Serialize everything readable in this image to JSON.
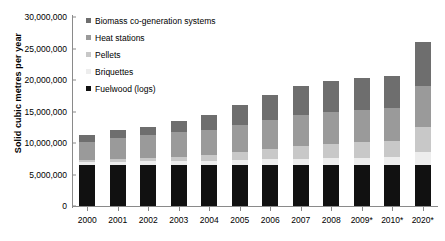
{
  "chart_data": {
    "type": "bar",
    "stacked": true,
    "title": "",
    "xlabel": "",
    "ylabel": "Solid cubic metres per year",
    "ylim": [
      0,
      30000000
    ],
    "ytick_step": 5000000,
    "ytick_labels": [
      "30,000,000",
      "25,000,000",
      "20,000,000",
      "15,000,000",
      "10,000,000",
      "5,000,000",
      "0"
    ],
    "ytick_values": [
      30000000,
      25000000,
      20000000,
      15000000,
      10000000,
      5000000,
      0
    ],
    "grid": false,
    "legend_position": "top-left",
    "categories": [
      "2000",
      "2001",
      "2002",
      "2003",
      "2004",
      "2005",
      "2006",
      "2007",
      "2008",
      "2009*",
      "2010*",
      "2020*"
    ],
    "series": [
      {
        "name": "Fuelwood (logs)",
        "color": "#111111",
        "values": [
          6500000,
          6500000,
          6500000,
          6500000,
          6500000,
          6500000,
          6500000,
          6500000,
          6500000,
          6500000,
          6500000,
          6500000
        ]
      },
      {
        "name": "Briquettes",
        "color": "#ededed",
        "values": [
          500000,
          500000,
          600000,
          600000,
          700000,
          800000,
          900000,
          1000000,
          1100000,
          1200000,
          1300000,
          2000000
        ]
      },
      {
        "name": "Pellets",
        "color": "#c8c8c8",
        "values": [
          300000,
          400000,
          500000,
          700000,
          900000,
          1200000,
          1600000,
          2000000,
          2300000,
          2400000,
          2500000,
          4000000
        ]
      },
      {
        "name": "Heat stations",
        "color": "#9a9a9a",
        "values": [
          2900000,
          3400000,
          3600000,
          3900000,
          4000000,
          4400000,
          4700000,
          5000000,
          5100000,
          5200000,
          5200000,
          6500000
        ]
      },
      {
        "name": "Biomass co-generation systems",
        "color": "#6e6e6e",
        "values": [
          1000000,
          1200000,
          1400000,
          1800000,
          2400000,
          3100000,
          3900000,
          4500000,
          4900000,
          5100000,
          5200000,
          7000000
        ]
      }
    ],
    "totals": [
      11200000,
      12000000,
      12600000,
      13500000,
      14500000,
      16000000,
      17600000,
      19000000,
      19900000,
      20400000,
      20700000,
      26000000
    ],
    "legend_order": [
      "Biomass co-generation systems",
      "Heat stations",
      "Pellets",
      "Briquettes",
      "Fuelwood (logs)"
    ]
  }
}
